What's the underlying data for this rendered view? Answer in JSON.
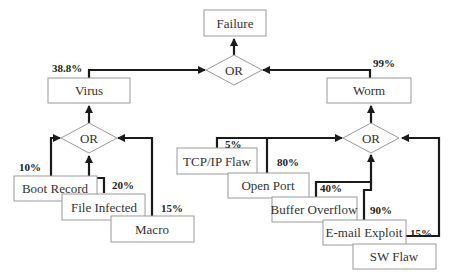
{
  "diagram": {
    "type": "fault-tree",
    "root": {
      "label": "Failure"
    },
    "gates": {
      "top": {
        "label": "OR"
      },
      "virus": {
        "label": "OR"
      },
      "worm": {
        "label": "OR"
      }
    },
    "intermediate": {
      "virus": {
        "label": "Virus",
        "probability": "38.8%"
      },
      "worm": {
        "label": "Worm",
        "probability": "99%"
      }
    },
    "virus_causes": [
      {
        "label": "Boot Record",
        "probability": "10%"
      },
      {
        "label": "File Infected",
        "probability": "20%"
      },
      {
        "label": "Macro",
        "probability": "15%"
      }
    ],
    "worm_causes": [
      {
        "label": "TCP/IP Flaw",
        "probability": "5%"
      },
      {
        "label": "Open Port",
        "probability": "80%"
      },
      {
        "label": "Buffer Overflow",
        "probability": "40%"
      },
      {
        "label": "E-mail Exploit",
        "probability": "90%"
      },
      {
        "label": "SW Flaw",
        "probability": "15%"
      }
    ]
  },
  "colors": {
    "box_border": "#9a9a9a",
    "wire": "#1a1a1a",
    "text": "#333333"
  }
}
